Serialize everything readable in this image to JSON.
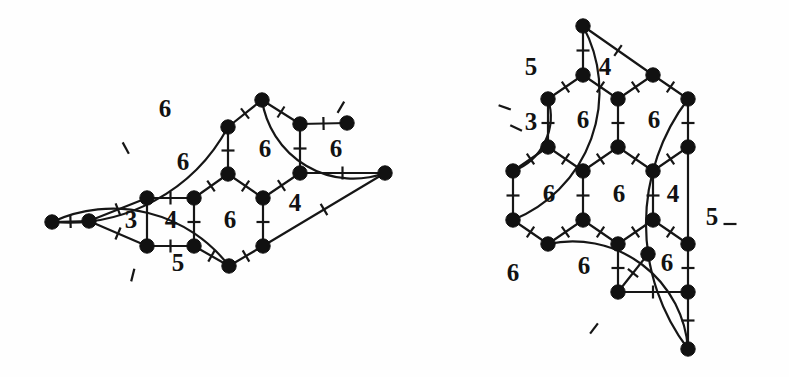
{
  "figure": {
    "background_color": "#fefefe",
    "ink_color": "#161616",
    "vertex_color": "#111111"
  },
  "left_graph": {
    "name": "left-graph",
    "face_labels": [
      {
        "id": "L-outerupper-6",
        "text": "6",
        "x": 165,
        "y": 111
      },
      {
        "id": "L-mid-6",
        "text": "6",
        "x": 183,
        "y": 164
      },
      {
        "id": "L-hex-top-6",
        "text": "6",
        "x": 265,
        "y": 151
      },
      {
        "id": "L-right-6",
        "text": "6",
        "x": 336,
        "y": 151
      },
      {
        "id": "L-tri-3",
        "text": "3",
        "x": 131,
        "y": 222
      },
      {
        "id": "L-sq-4",
        "text": "4",
        "x": 171,
        "y": 222
      },
      {
        "id": "L-hex-bot-6",
        "text": "6",
        "x": 230,
        "y": 222
      },
      {
        "id": "L-quad-4",
        "text": "4",
        "x": 295,
        "y": 205
      },
      {
        "id": "L-bottom-5",
        "text": "5",
        "x": 178,
        "y": 265
      }
    ],
    "vertices": [
      {
        "id": "a",
        "x": 52,
        "y": 222
      },
      {
        "id": "b",
        "x": 89,
        "y": 221
      },
      {
        "id": "c",
        "x": 147,
        "y": 198
      },
      {
        "id": "d",
        "x": 194,
        "y": 198
      },
      {
        "id": "e",
        "x": 147,
        "y": 246
      },
      {
        "id": "f",
        "x": 194,
        "y": 246
      },
      {
        "id": "g",
        "x": 228,
        "y": 174
      },
      {
        "id": "h",
        "x": 228,
        "y": 127
      },
      {
        "id": "i",
        "x": 262,
        "y": 100
      },
      {
        "id": "j",
        "x": 300,
        "y": 124
      },
      {
        "id": "k",
        "x": 347,
        "y": 123
      },
      {
        "id": "l",
        "x": 300,
        "y": 173
      },
      {
        "id": "m",
        "x": 385,
        "y": 173
      },
      {
        "id": "n",
        "x": 263,
        "y": 198
      },
      {
        "id": "o",
        "x": 263,
        "y": 246
      },
      {
        "id": "p",
        "x": 229,
        "y": 266
      }
    ],
    "edges": [
      {
        "from": "a",
        "to": "b",
        "kind": "line",
        "ticks": 1
      },
      {
        "from": "b",
        "to": "c",
        "kind": "line",
        "ticks": 1
      },
      {
        "from": "b",
        "to": "e",
        "kind": "line",
        "ticks": 1
      },
      {
        "from": "c",
        "to": "d",
        "kind": "line",
        "ticks": 1
      },
      {
        "from": "c",
        "to": "e",
        "kind": "line",
        "ticks": 0
      },
      {
        "from": "d",
        "to": "f",
        "kind": "line",
        "ticks": 1
      },
      {
        "from": "e",
        "to": "f",
        "kind": "line",
        "ticks": 1
      },
      {
        "from": "d",
        "to": "g",
        "kind": "line",
        "ticks": 1
      },
      {
        "from": "g",
        "to": "h",
        "kind": "line",
        "ticks": 1
      },
      {
        "from": "h",
        "to": "i",
        "kind": "line",
        "ticks": 1
      },
      {
        "from": "i",
        "to": "j",
        "kind": "line",
        "ticks": 1
      },
      {
        "from": "j",
        "to": "k",
        "kind": "line",
        "ticks": 1
      },
      {
        "from": "j",
        "to": "l",
        "kind": "line",
        "ticks": 1
      },
      {
        "from": "l",
        "to": "m",
        "kind": "line",
        "ticks": 1
      },
      {
        "from": "g",
        "to": "n",
        "kind": "line",
        "ticks": 1
      },
      {
        "from": "n",
        "to": "l",
        "kind": "line",
        "ticks": 1
      },
      {
        "from": "n",
        "to": "o",
        "kind": "line",
        "ticks": 1
      },
      {
        "from": "f",
        "to": "p",
        "kind": "line",
        "ticks": 1
      },
      {
        "from": "p",
        "to": "o",
        "kind": "line",
        "ticks": 1
      },
      {
        "from": "o",
        "to": "m",
        "kind": "line",
        "ticks": 1
      },
      {
        "from": "a",
        "to": "h",
        "kind": "arc",
        "sweep": 0,
        "bow": 30,
        "ticks": 1
      },
      {
        "from": "i",
        "to": "m",
        "kind": "arc",
        "sweep": 0,
        "bow": 34,
        "ticks": 1
      },
      {
        "from": "a",
        "to": "p",
        "kind": "arc",
        "sweep": 1,
        "bow": 32,
        "ticks": 1
      }
    ]
  },
  "right_graph": {
    "name": "right-graph",
    "face_labels": [
      {
        "id": "R-upperleft-5",
        "text": "5",
        "x": 531,
        "y": 69
      },
      {
        "id": "R-top-4",
        "text": "4",
        "x": 605,
        "y": 69
      },
      {
        "id": "R-tri-3",
        "text": "3",
        "x": 531,
        "y": 124
      },
      {
        "id": "R-hexA-6",
        "text": "6",
        "x": 583,
        "y": 122
      },
      {
        "id": "R-hexB-6",
        "text": "6",
        "x": 654,
        "y": 122
      },
      {
        "id": "R-hexC-6",
        "text": "6",
        "x": 549,
        "y": 196
      },
      {
        "id": "R-hexD-6",
        "text": "6",
        "x": 619,
        "y": 196
      },
      {
        "id": "R-sq-4",
        "text": "4",
        "x": 673,
        "y": 196
      },
      {
        "id": "R-right-5",
        "text": "5",
        "x": 712,
        "y": 219
      },
      {
        "id": "R-bottomleft-6",
        "text": "6",
        "x": 513,
        "y": 275
      },
      {
        "id": "R-bot-6",
        "text": "6",
        "x": 584,
        "y": 268
      },
      {
        "id": "R-botright-6",
        "text": "6",
        "x": 667,
        "y": 265
      }
    ],
    "vertices": [
      {
        "id": "t",
        "x": 583,
        "y": 26
      },
      {
        "id": "u",
        "x": 583,
        "y": 75
      },
      {
        "id": "v",
        "x": 548,
        "y": 99
      },
      {
        "id": "w",
        "x": 618,
        "y": 99
      },
      {
        "id": "x",
        "x": 653,
        "y": 75
      },
      {
        "id": "y",
        "x": 688,
        "y": 99
      },
      {
        "id": "z",
        "x": 548,
        "y": 147
      },
      {
        "id": "A",
        "x": 618,
        "y": 147
      },
      {
        "id": "B",
        "x": 688,
        "y": 147
      },
      {
        "id": "C",
        "x": 513,
        "y": 171
      },
      {
        "id": "D",
        "x": 583,
        "y": 171
      },
      {
        "id": "E",
        "x": 653,
        "y": 171
      },
      {
        "id": "F",
        "x": 513,
        "y": 220
      },
      {
        "id": "G",
        "x": 583,
        "y": 220
      },
      {
        "id": "H",
        "x": 653,
        "y": 220
      },
      {
        "id": "I",
        "x": 688,
        "y": 244
      },
      {
        "id": "J",
        "x": 548,
        "y": 244
      },
      {
        "id": "K",
        "x": 618,
        "y": 244
      },
      {
        "id": "L",
        "x": 618,
        "y": 292
      },
      {
        "id": "M",
        "x": 688,
        "y": 292
      },
      {
        "id": "N",
        "x": 688,
        "y": 349
      },
      {
        "id": "P",
        "x": 648,
        "y": 254
      }
    ],
    "edges": [
      {
        "from": "t",
        "to": "u",
        "kind": "line",
        "ticks": 1
      },
      {
        "from": "t",
        "to": "x",
        "kind": "line",
        "ticks": 1
      },
      {
        "from": "u",
        "to": "v",
        "kind": "line",
        "ticks": 1
      },
      {
        "from": "u",
        "to": "w",
        "kind": "line",
        "ticks": 1
      },
      {
        "from": "w",
        "to": "x",
        "kind": "line",
        "ticks": 1
      },
      {
        "from": "x",
        "to": "y",
        "kind": "line",
        "ticks": 1
      },
      {
        "from": "v",
        "to": "z",
        "kind": "line",
        "ticks": 1
      },
      {
        "from": "w",
        "to": "A",
        "kind": "line",
        "ticks": 1
      },
      {
        "from": "y",
        "to": "B",
        "kind": "line",
        "ticks": 1
      },
      {
        "from": "z",
        "to": "C",
        "kind": "line",
        "ticks": 1
      },
      {
        "from": "z",
        "to": "D",
        "kind": "line",
        "ticks": 1
      },
      {
        "from": "A",
        "to": "D",
        "kind": "line",
        "ticks": 1
      },
      {
        "from": "A",
        "to": "E",
        "kind": "line",
        "ticks": 1
      },
      {
        "from": "B",
        "to": "E",
        "kind": "line",
        "ticks": 1
      },
      {
        "from": "C",
        "to": "F",
        "kind": "line",
        "ticks": 1
      },
      {
        "from": "D",
        "to": "G",
        "kind": "line",
        "ticks": 1
      },
      {
        "from": "E",
        "to": "H",
        "kind": "line",
        "ticks": 1
      },
      {
        "from": "B",
        "to": "I",
        "kind": "line",
        "ticks": 0
      },
      {
        "from": "F",
        "to": "J",
        "kind": "line",
        "ticks": 1
      },
      {
        "from": "G",
        "to": "J",
        "kind": "line",
        "ticks": 1
      },
      {
        "from": "G",
        "to": "K",
        "kind": "line",
        "ticks": 1
      },
      {
        "from": "H",
        "to": "K",
        "kind": "line",
        "ticks": 1
      },
      {
        "from": "H",
        "to": "I",
        "kind": "line",
        "ticks": 1
      },
      {
        "from": "K",
        "to": "L",
        "kind": "line",
        "ticks": 1
      },
      {
        "from": "L",
        "to": "M",
        "kind": "line",
        "ticks": 1
      },
      {
        "from": "I",
        "to": "M",
        "kind": "line",
        "ticks": 1
      },
      {
        "from": "M",
        "to": "N",
        "kind": "line",
        "ticks": 1
      },
      {
        "from": "L",
        "to": "P",
        "kind": "line",
        "ticks": 1
      },
      {
        "from": "v",
        "to": "C",
        "kind": "arc",
        "sweep": 1,
        "bow": 16,
        "ticks": 1
      },
      {
        "from": "t",
        "to": "F",
        "kind": "arc",
        "sweep": 1,
        "bow": 46,
        "ticks": 1
      },
      {
        "from": "J",
        "to": "N",
        "kind": "arc",
        "sweep": 1,
        "bow": 40,
        "ticks": 1
      },
      {
        "from": "y",
        "to": "N",
        "kind": "arc",
        "sweep": 0,
        "bow": 42,
        "ticks": 1
      }
    ]
  }
}
